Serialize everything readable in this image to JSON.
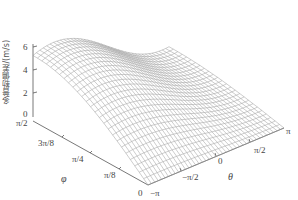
{
  "chart_data": {
    "type": "surface3d",
    "title": "",
    "zlabel": "多普勒偏差/(m/s)",
    "xlabel": "θ",
    "ylabel": "φ",
    "x_ticks": [
      "−π",
      "−π/2",
      "0",
      "π/2",
      "π"
    ],
    "y_ticks": [
      "0",
      "π/8",
      "π/4",
      "3π/8",
      "π/2"
    ],
    "z_ticks": [
      "0",
      "2",
      "4",
      "6"
    ],
    "xlim": [
      -3.1416,
      3.1416
    ],
    "ylim": [
      0,
      1.5708
    ],
    "zlim": [
      0,
      6
    ],
    "grid": false,
    "sample_surface": {
      "theta": [
        -3.1416,
        -1.5708,
        0,
        1.5708,
        3.1416
      ],
      "phi": [
        0,
        0.3927,
        0.7854,
        1.1781,
        1.5708
      ],
      "z": [
        [
          0.0,
          0.0,
          0.0,
          0.0,
          0.0
        ],
        [
          2.2,
          2.0,
          1.6,
          1.0,
          0.6
        ],
        [
          4.1,
          3.8,
          3.1,
          2.0,
          1.2
        ],
        [
          5.4,
          5.0,
          4.0,
          2.6,
          1.6
        ],
        [
          5.9,
          5.5,
          4.4,
          2.9,
          1.8
        ]
      ]
    }
  }
}
